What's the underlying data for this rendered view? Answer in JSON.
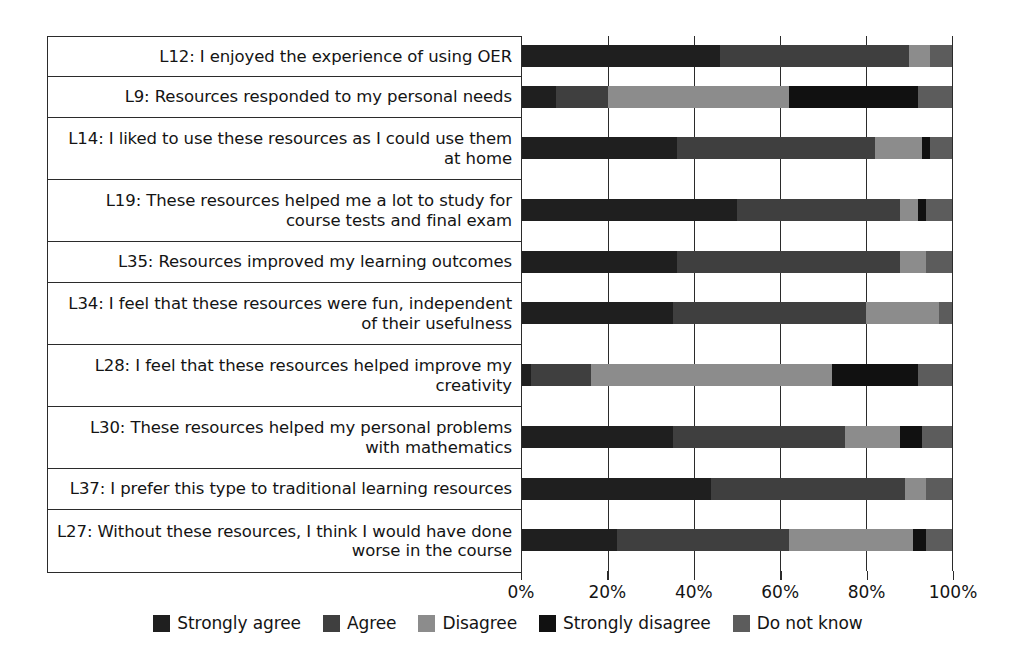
{
  "chart_data": {
    "type": "bar",
    "orientation": "horizontal",
    "stacked": true,
    "normalized_percent": true,
    "title": "",
    "subtitle": "",
    "xlabel": "",
    "ylabel": "",
    "xlim": [
      0,
      100
    ],
    "xticks": [
      0,
      20,
      40,
      60,
      80,
      100
    ],
    "xtick_labels": [
      "0%",
      "20%",
      "40%",
      "60%",
      "80%",
      "100%"
    ],
    "grid": true,
    "grid_axis": "x",
    "legend_position": "bottom",
    "categories": [
      "L12: I enjoyed the experience of using OER",
      "L9: Resources responded to my personal needs",
      "L14: I liked to use these resources as I could use them at home",
      "L19: These resources helped me a lot to study for course tests and final exam",
      "L35: Resources improved my learning outcomes",
      "L34: I feel that these resources were fun, independent of their usefulness",
      "L28: I feel that these resources helped improve my creativity",
      "L30: These resources helped my personal problems with mathematics",
      "L37: I prefer this type to traditional learning resources",
      "L27: Without these resources, I think I would have done worse in the course"
    ],
    "series": [
      {
        "name": "Strongly agree",
        "color": "#1f1f1f",
        "values": [
          46,
          8,
          36,
          50,
          36,
          35,
          2,
          35,
          44,
          22
        ]
      },
      {
        "name": "Agree",
        "color": "#3f3f3f",
        "values": [
          44,
          12,
          46,
          38,
          52,
          45,
          14,
          40,
          45,
          40
        ]
      },
      {
        "name": "Disagree",
        "color": "#8c8c8c",
        "values": [
          5,
          42,
          11,
          4,
          6,
          17,
          56,
          13,
          5,
          29
        ]
      },
      {
        "name": "Strongly disagree",
        "color": "#111111",
        "values": [
          0,
          30,
          2,
          2,
          0,
          0,
          20,
          5,
          0,
          3
        ]
      },
      {
        "name": "Do not know",
        "color": "#5c5c5c",
        "values": [
          5,
          8,
          5,
          6,
          6,
          3,
          8,
          7,
          6,
          6
        ]
      }
    ]
  },
  "legend": {
    "items": [
      {
        "label": "Strongly agree",
        "color": "#1f1f1f"
      },
      {
        "label": "Agree",
        "color": "#3f3f3f"
      },
      {
        "label": "Disagree",
        "color": "#8c8c8c"
      },
      {
        "label": "Strongly disagree",
        "color": "#111111"
      },
      {
        "label": "Do not know",
        "color": "#5c5c5c"
      }
    ]
  },
  "row_heights": [
    40,
    41,
    62,
    62,
    41,
    62,
    62,
    62,
    41,
    62
  ]
}
